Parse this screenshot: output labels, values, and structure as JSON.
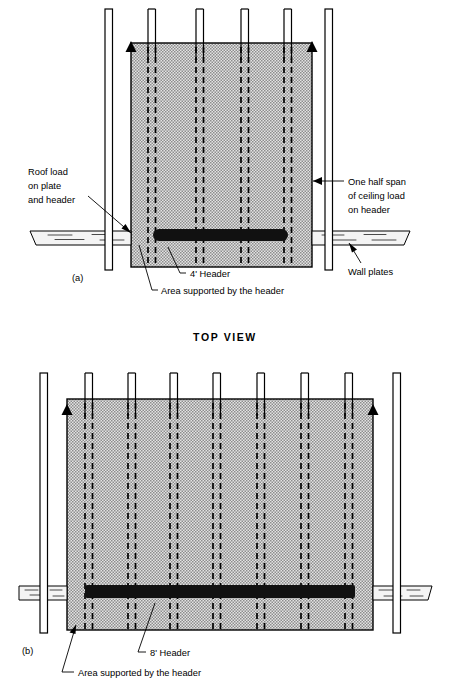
{
  "figure": {
    "section_title": "TOP VIEW",
    "colors": {
      "ink": "#000000",
      "paper": "#ffffff",
      "hatch_fill": "#c9c9c9",
      "header_bar": "#111111",
      "wood": "#f2f2f2"
    },
    "panels": [
      {
        "id": "panel-a",
        "panel_label": "(a)",
        "header_label": "4' Header",
        "header_span_ft": 4,
        "stud_count": 4,
        "wall_plate_count": 2,
        "callouts": [
          {
            "name": "roof-load-callout",
            "lines": [
              "Roof load",
              "on plate",
              "and header"
            ]
          },
          {
            "name": "ceiling-load-callout",
            "lines": [
              "One half span",
              "of ceiling load",
              "on header"
            ]
          },
          {
            "name": "wall-plates-callout",
            "lines": [
              "Wall plates"
            ]
          },
          {
            "name": "area-supported-callout",
            "lines": [
              "Area supported by the header"
            ]
          }
        ]
      },
      {
        "id": "panel-b",
        "panel_label": "(b)",
        "header_label": "8' Header",
        "header_span_ft": 8,
        "stud_count": 7,
        "wall_plate_count": 2,
        "callouts": [
          {
            "name": "area-supported-callout",
            "lines": [
              "Area supported by the header"
            ]
          }
        ]
      }
    ]
  },
  "labels": {
    "a_panel_id": "(a)",
    "a_roof_load_1": "Roof load",
    "a_roof_load_2": "on plate",
    "a_roof_load_3": "and header",
    "a_ceiling_1": "One half span",
    "a_ceiling_2": "of ceiling load",
    "a_ceiling_3": "on header",
    "a_wall_plates": "Wall plates",
    "a_header": "4' Header",
    "a_area_supported": "Area supported by the header",
    "section_title": "TOP VIEW",
    "b_panel_id": "(b)",
    "b_header": "8' Header",
    "b_area_supported": "Area supported by the header"
  }
}
